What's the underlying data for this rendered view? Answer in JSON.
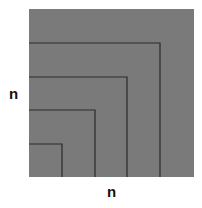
{
  "diagram": {
    "colors": {
      "fill": "#7a7a7a",
      "line": "#2a2a2a",
      "background": "#ffffff"
    },
    "labels": {
      "left": "n",
      "bottom": "n"
    },
    "nested_squares": 5
  }
}
